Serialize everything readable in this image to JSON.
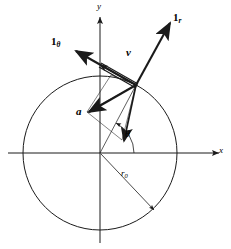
{
  "figure": {
    "background_color": "#ffffff",
    "stroke_color": "#1a1a1a",
    "axes": {
      "x_label": "x",
      "y_label": "y",
      "origin": {
        "x": 100,
        "y": 153
      },
      "x_range": [
        8,
        224
      ],
      "y_range": [
        12,
        243
      ]
    },
    "circle": {
      "center": {
        "x": 100,
        "y": 153
      },
      "radius": 77,
      "label": "r",
      "label_subscript": "0",
      "label_position": {
        "x": 123,
        "y": 173
      }
    },
    "angle": {
      "label": "θ",
      "label_position": {
        "x": 126,
        "y": 134
      },
      "arc_radius": 34,
      "degrees": 62
    },
    "point_on_circle": {
      "x": 136,
      "y": 85
    },
    "vectors": [
      {
        "name": "unit-vector-radial",
        "label": "1",
        "subscript": "r",
        "label_position": {
          "x": 174,
          "y": 14
        },
        "from": {
          "x": 136,
          "y": 85
        },
        "to": {
          "x": 168,
          "y": 25
        },
        "style": "bold"
      },
      {
        "name": "unit-vector-tangential",
        "label": "1",
        "subscript": "θ",
        "label_position": {
          "x": 52,
          "y": 38
        },
        "from": {
          "x": 136,
          "y": 85
        },
        "to": {
          "x": 80,
          "y": 53
        },
        "style": "bold"
      },
      {
        "name": "velocity-vector",
        "label": "v",
        "label_position": {
          "x": 127,
          "y": 51
        },
        "from": {
          "x": 136,
          "y": 85
        },
        "to": {
          "x": 96,
          "y": 62
        },
        "style": "bold-double"
      },
      {
        "name": "acceleration-vector",
        "label": "a",
        "label_position": {
          "x": 78,
          "y": 110
        },
        "from": {
          "x": 136,
          "y": 85
        },
        "to": {
          "x": 88,
          "y": 113
        },
        "style": "bold"
      }
    ]
  }
}
